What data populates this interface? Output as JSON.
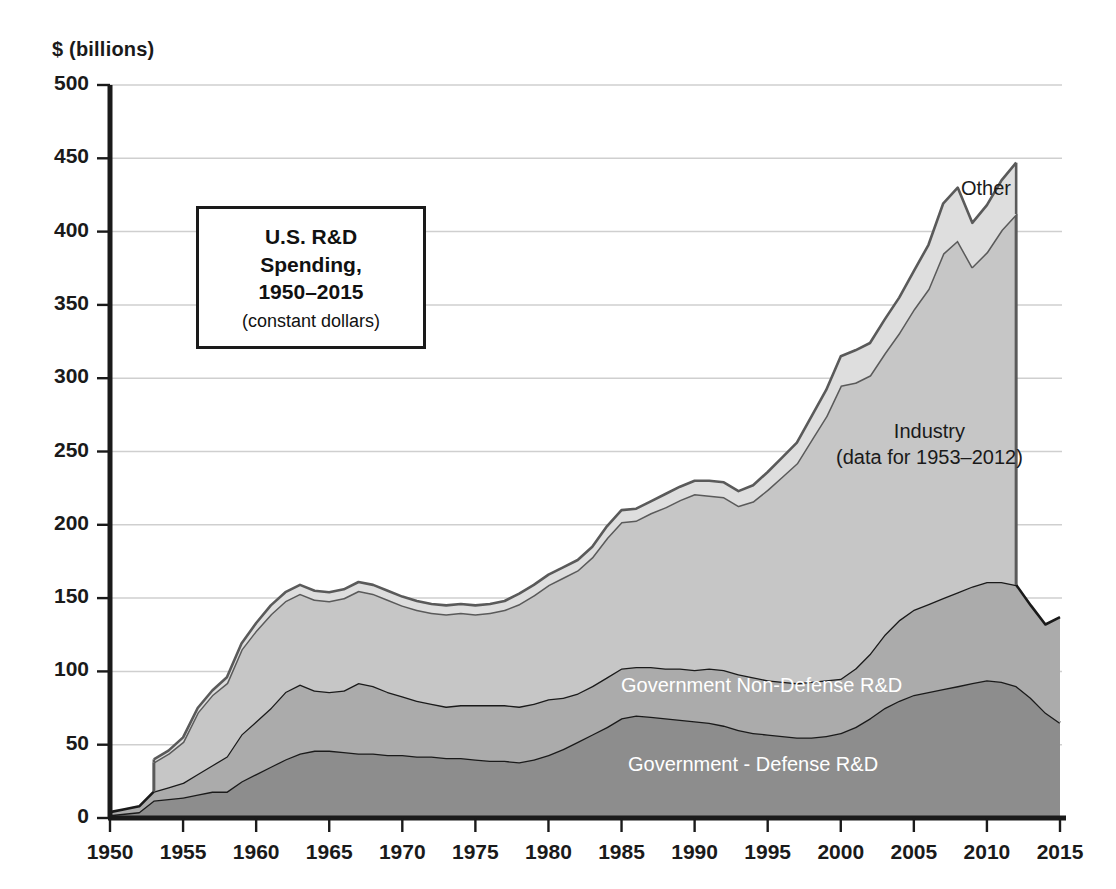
{
  "axes": {
    "y_unit_label": "$ (billions)",
    "y_ticks": [
      "500",
      "450",
      "400",
      "350",
      "300",
      "250",
      "200",
      "150",
      "100",
      "50",
      "0"
    ],
    "x_ticks": [
      "1950",
      "1955",
      "1960",
      "1965",
      "1970",
      "1975",
      "1980",
      "1985",
      "1990",
      "1995",
      "2000",
      "2005",
      "2010",
      "2015"
    ]
  },
  "title_box": {
    "line1": "U.S. R&D",
    "line2": "Spending,",
    "line3": "1950–2015",
    "subtitle": "(constant dollars)"
  },
  "series_labels": {
    "other": "Other",
    "industry_line1": "Industry",
    "industry_line2": "(data for 1953–2012)",
    "gov_nondefense": "Government Non-Defense R&D",
    "gov_defense": "Government - Defense R&D"
  },
  "colors": {
    "defense": "#8d8d8d",
    "nondefense": "#ababab",
    "industry": "#c6c6c6",
    "other": "#dedede",
    "outline_dark": "#1a1a1a",
    "outline_mid": "#5a5a5a",
    "gridline": "#cfcfcf",
    "axis": "#1a1a1a",
    "background": "#ffffff"
  },
  "chart_data": {
    "type": "area",
    "stacked": true,
    "title": "U.S. R&D Spending, 1950–2015 (constant dollars)",
    "xlabel": "",
    "ylabel": "$ (billions)",
    "xlim": [
      1950,
      2015
    ],
    "ylim": [
      0,
      500
    ],
    "ytick_step": 50,
    "xtick_step": 5,
    "grid": true,
    "legend_position": "inline-annotations",
    "notes": [
      "Stacking order bottom-to-top: Government - Defense R&D, Government Non-Defense R&D, Industry, Other",
      "Industry and Other series only contain data for 1953–2012; outside that range they are zero, producing the step at 1953 and the drop after 2012"
    ],
    "x": [
      1950,
      1951,
      1952,
      1953,
      1954,
      1955,
      1956,
      1957,
      1958,
      1959,
      1960,
      1961,
      1962,
      1963,
      1964,
      1965,
      1966,
      1967,
      1968,
      1969,
      1970,
      1971,
      1972,
      1973,
      1974,
      1975,
      1976,
      1977,
      1978,
      1979,
      1980,
      1981,
      1982,
      1983,
      1984,
      1985,
      1986,
      1987,
      1988,
      1989,
      1990,
      1991,
      1992,
      1993,
      1994,
      1995,
      1996,
      1997,
      1998,
      1999,
      2000,
      2001,
      2002,
      2003,
      2004,
      2005,
      2006,
      2007,
      2008,
      2009,
      2010,
      2011,
      2012,
      2013,
      2014,
      2015
    ],
    "series": [
      {
        "name": "Government - Defense R&D",
        "values": [
          2,
          3,
          4,
          12,
          13,
          14,
          16,
          18,
          18,
          25,
          30,
          35,
          40,
          44,
          46,
          46,
          45,
          44,
          44,
          43,
          43,
          42,
          42,
          41,
          41,
          40,
          39,
          39,
          38,
          40,
          43,
          47,
          52,
          57,
          62,
          68,
          70,
          69,
          68,
          67,
          66,
          65,
          63,
          60,
          58,
          57,
          56,
          55,
          55,
          56,
          58,
          62,
          68,
          75,
          80,
          84,
          86,
          88,
          90,
          92,
          94,
          93,
          90,
          82,
          72,
          65
        ]
      },
      {
        "name": "Government Non-Defense R&D",
        "values": [
          2,
          3,
          4,
          6,
          8,
          10,
          14,
          18,
          24,
          32,
          36,
          40,
          46,
          47,
          41,
          40,
          42,
          48,
          46,
          43,
          40,
          38,
          36,
          35,
          36,
          37,
          38,
          38,
          38,
          38,
          38,
          35,
          33,
          33,
          34,
          34,
          33,
          34,
          34,
          35,
          35,
          37,
          38,
          38,
          38,
          37,
          37,
          37,
          38,
          38,
          37,
          40,
          44,
          50,
          55,
          58,
          60,
          62,
          64,
          66,
          67,
          68,
          69,
          63,
          60,
          72
        ]
      },
      {
        "name": "Industry",
        "values": [
          0,
          0,
          0,
          20,
          23,
          28,
          42,
          48,
          50,
          58,
          62,
          64,
          62,
          62,
          62,
          62,
          63,
          63,
          63,
          63,
          62,
          62,
          62,
          63,
          63,
          62,
          63,
          65,
          70,
          74,
          78,
          82,
          84,
          88,
          95,
          100,
          100,
          105,
          110,
          115,
          120,
          118,
          118,
          115,
          120,
          130,
          140,
          150,
          165,
          180,
          200,
          195,
          190,
          192,
          196,
          205,
          215,
          235,
          240,
          218,
          225,
          240,
          253,
          0,
          0,
          0
        ]
      },
      {
        "name": "Other",
        "values": [
          0,
          0,
          0,
          2,
          2,
          3,
          3,
          3,
          4,
          4,
          5,
          6,
          6,
          6,
          6,
          6,
          6,
          6,
          6,
          6,
          6,
          6,
          6,
          6,
          6,
          6,
          6,
          6,
          7,
          7,
          7,
          7,
          7,
          7,
          8,
          8,
          8,
          8,
          9,
          9,
          9,
          10,
          10,
          10,
          11,
          12,
          13,
          14,
          16,
          18,
          20,
          22,
          22,
          23,
          24,
          26,
          30,
          34,
          36,
          30,
          32,
          34,
          35,
          0,
          0,
          0
        ]
      }
    ]
  }
}
